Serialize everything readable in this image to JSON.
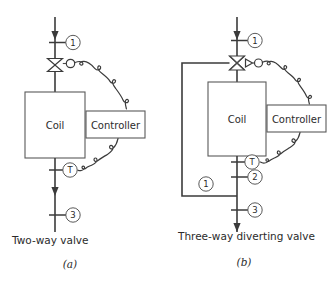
{
  "figure": {
    "panels": [
      {
        "id": "a",
        "caption": "Two-way valve",
        "figure_label": "(a)",
        "coil_label": "Coil",
        "controller_label": "Controller",
        "valve_type": "two-way",
        "markers": [
          {
            "label": "1",
            "role": "inlet-port"
          },
          {
            "label": "T",
            "role": "temperature-sensor"
          },
          {
            "label": "3",
            "role": "outlet-port"
          }
        ]
      },
      {
        "id": "b",
        "caption": "Three-way diverting valve",
        "figure_label": "(b)",
        "coil_label": "Coil",
        "controller_label": "Controller",
        "valve_type": "three-way-diverting",
        "markers": [
          {
            "label": "1",
            "role": "inlet-port"
          },
          {
            "label": "T",
            "role": "temperature-sensor"
          },
          {
            "label": "2",
            "role": "bypass-port"
          },
          {
            "label": "1",
            "role": "bypass-line-label"
          },
          {
            "label": "3",
            "role": "outlet-port"
          }
        ]
      }
    ]
  },
  "colors": {
    "line": "#3b3b3b",
    "box_stroke": "#5a5a5a",
    "background": "#ffffff",
    "text": "#2b2b2b"
  }
}
